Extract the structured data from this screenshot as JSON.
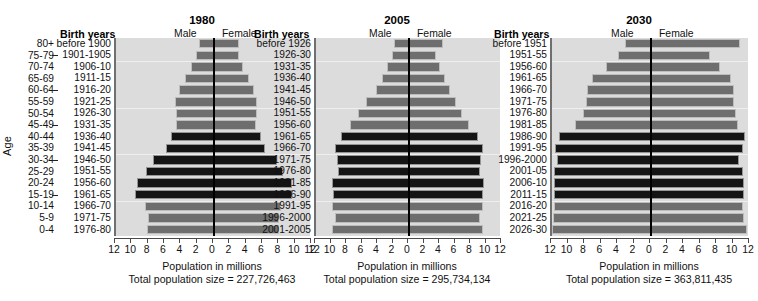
{
  "axis_label": "Age",
  "age_groups": [
    "80+",
    "75-79",
    "70-74",
    "65-69",
    "60-64",
    "55-59",
    "50-54",
    "45-49",
    "40-44",
    "35-39",
    "30-34",
    "25-29",
    "20-24",
    "15-19",
    "10-14",
    "5-9",
    "0-4"
  ],
  "headers": {
    "birth_years": "Birth years",
    "male": "Male",
    "female": "Female"
  },
  "xlabel": "Population in millions",
  "colors": {
    "bar_gray": "#6e6e6e",
    "bar_black": "#141414",
    "plot_bg": "#dcdcdc",
    "center_line": "#000000"
  },
  "chart_data": {
    "type": "bar",
    "xlabel": "Population in millions",
    "ylabel": "Age",
    "xlim": [
      -12,
      12
    ],
    "xticks": [
      12,
      10,
      8,
      6,
      4,
      2,
      0,
      2,
      4,
      6,
      8,
      10,
      12
    ],
    "grid": false,
    "legend": [
      "Male",
      "Female"
    ],
    "panels": [
      {
        "year": "1980",
        "total_population_label": "Total population size = 227,726,463",
        "total_population": 227726463,
        "birth_years": [
          "before 1900",
          "1901-1905",
          "1906-10",
          "1911-15",
          "1916-20",
          "1921-25",
          "1926-30",
          "1931-35",
          "1936-40",
          "1941-45",
          "1946-50",
          "1951-55",
          "1956-60",
          "1961-65",
          "1966-70",
          "1971-75",
          "1976-80"
        ],
        "male": [
          1.8,
          2.2,
          2.8,
          3.5,
          4.3,
          4.8,
          4.7,
          4.6,
          5.3,
          5.9,
          7.5,
          8.3,
          9.4,
          9.7,
          8.4,
          8.1,
          8.2
        ],
        "female": [
          3.0,
          3.0,
          3.6,
          4.3,
          4.9,
          5.3,
          5.3,
          5.1,
          5.7,
          6.2,
          7.7,
          8.4,
          9.5,
          9.6,
          8.2,
          7.9,
          8.0
        ],
        "shade": [
          "gray",
          "gray",
          "gray",
          "gray",
          "gray",
          "gray",
          "gray",
          "gray",
          "black",
          "black",
          "black",
          "black",
          "black",
          "black",
          "gray",
          "gray",
          "gray"
        ]
      },
      {
        "year": "2005",
        "total_population_label": "Total population size = 295,734,134",
        "total_population": 295734134,
        "birth_years": [
          "before 1926",
          "1926-30",
          "1931-35",
          "1936-40",
          "1941-45",
          "1946-50",
          "1951-55",
          "1956-60",
          "1961-65",
          "1966-70",
          "1971-75",
          "1976-80",
          "1981-85",
          "1986-90",
          "1991-95",
          "1996-2000",
          "2001-2005"
        ],
        "male": [
          2.0,
          2.2,
          2.8,
          3.5,
          4.3,
          5.5,
          6.6,
          7.6,
          8.8,
          9.6,
          9.3,
          9.2,
          9.9,
          9.8,
          9.9,
          9.6,
          9.9
        ],
        "female": [
          4.4,
          3.5,
          4.0,
          4.6,
          5.3,
          6.0,
          6.9,
          7.8,
          8.9,
          9.6,
          9.3,
          9.2,
          9.7,
          9.5,
          9.5,
          9.2,
          9.5
        ],
        "shade": [
          "gray",
          "gray",
          "gray",
          "gray",
          "gray",
          "gray",
          "gray",
          "gray",
          "black",
          "black",
          "black",
          "black",
          "black",
          "black",
          "gray",
          "gray",
          "gray"
        ]
      },
      {
        "year": "2030",
        "total_population_label": "Total population size = 363,811,435",
        "total_population": 363811435,
        "birth_years": [
          "before 1951",
          "1951-55",
          "1956-60",
          "1961-65",
          "1966-70",
          "1971-75",
          "1976-80",
          "1981-85",
          "1986-90",
          "1991-95",
          "1996-2000",
          "2001-05",
          "2006-10",
          "2011-15",
          "2016-20",
          "2021-25",
          "2026-30"
        ],
        "male": [
          3.2,
          4.0,
          5.5,
          7.2,
          7.8,
          7.9,
          8.3,
          9.2,
          11.2,
          11.6,
          11.4,
          11.7,
          11.7,
          11.8,
          11.8,
          11.9,
          12.0
        ],
        "female": [
          10.8,
          7.2,
          8.4,
          9.7,
          10.0,
          10.1,
          10.3,
          10.6,
          11.4,
          11.2,
          10.7,
          11.2,
          11.3,
          11.3,
          11.2,
          11.3,
          11.6
        ],
        "shade": [
          "gray",
          "gray",
          "gray",
          "gray",
          "gray",
          "gray",
          "gray",
          "gray",
          "black",
          "black",
          "black",
          "black",
          "black",
          "black",
          "gray",
          "gray",
          "gray"
        ]
      }
    ]
  }
}
